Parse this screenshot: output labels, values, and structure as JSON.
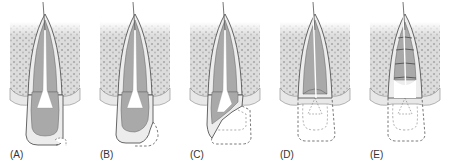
{
  "figure": {
    "panels": [
      {
        "id": "A",
        "label": "(A)",
        "stage": "intact-crown-with-small-fracture",
        "dashed_crown": "small-corner",
        "dashed_pulp": false,
        "crown_present": "full",
        "root_bands": false
      },
      {
        "id": "B",
        "label": "(B)",
        "stage": "larger-corner-fracture",
        "dashed_crown": "corner",
        "dashed_pulp": false,
        "crown_present": "most",
        "root_bands": false
      },
      {
        "id": "C",
        "label": "(C)",
        "stage": "oblique-fracture-exposing-pulp",
        "dashed_crown": "half",
        "dashed_pulp": false,
        "crown_present": "partial",
        "root_bands": false
      },
      {
        "id": "D",
        "label": "(D)",
        "stage": "crown-lost-at-cervical-level",
        "dashed_crown": "full",
        "dashed_pulp": true,
        "crown_present": "none",
        "root_bands": false
      },
      {
        "id": "E",
        "label": "(E)",
        "stage": "crown-lost-root-with-horizontal-levels",
        "dashed_crown": "full",
        "dashed_pulp": true,
        "crown_present": "none",
        "root_bands": true
      }
    ],
    "colors": {
      "bone_fill": "#d9d9d9",
      "bone_dots": "#a8a8a8",
      "gingiva": "#e6e6e6",
      "dentin": "#ebebeb",
      "pulp": "#a9a9a9",
      "outline": "#555555",
      "dashed": "#555555",
      "pulp_chamber": "#ffffff",
      "label_text": "#333333"
    }
  }
}
